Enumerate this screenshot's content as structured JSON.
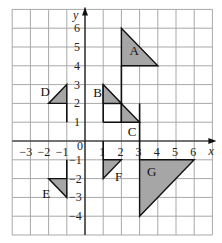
{
  "diagram": {
    "grid": {
      "x_min": -4,
      "x_max": 7,
      "y_min": -5,
      "y_max": 7,
      "origin_px": [
        85,
        141
      ],
      "cell_w": 18.2,
      "cell_h": 18.8
    },
    "axes": {
      "x_label": "x",
      "y_label": "y",
      "origin_label": "0",
      "x_ticks": [
        {
          "value": -3,
          "label": "−3"
        },
        {
          "value": -2,
          "label": "−2"
        },
        {
          "value": -1,
          "label": "−1"
        },
        {
          "value": 1,
          "label": "1"
        },
        {
          "value": 2,
          "label": "2"
        },
        {
          "value": 3,
          "label": "3"
        },
        {
          "value": 4,
          "label": "4"
        },
        {
          "value": 5,
          "label": "5"
        },
        {
          "value": 6,
          "label": "6"
        }
      ],
      "y_ticks": [
        {
          "value": 6,
          "label": "6"
        },
        {
          "value": 5,
          "label": "5"
        },
        {
          "value": 4,
          "label": "4"
        },
        {
          "value": 3,
          "label": "3"
        },
        {
          "value": 2,
          "label": "2"
        },
        {
          "value": 1,
          "label": "1"
        },
        {
          "value": -1,
          "label": "−1"
        },
        {
          "value": -2,
          "label": "−2"
        },
        {
          "value": -3,
          "label": "−3"
        },
        {
          "value": -4,
          "label": "−4"
        }
      ]
    },
    "shapes": [
      {
        "label": "A",
        "vertices": [
          [
            2,
            6
          ],
          [
            2,
            4
          ],
          [
            4,
            4
          ]
        ],
        "label_pos": [
          2.45,
          4.6
        ]
      },
      {
        "label": "B",
        "vertices": [
          [
            1,
            3
          ],
          [
            1,
            2
          ],
          [
            2,
            2
          ]
        ],
        "label_pos": [
          0.45,
          2.35
        ]
      },
      {
        "label": "C",
        "vertices": [
          [
            2,
            2
          ],
          [
            2,
            1
          ],
          [
            3,
            1
          ]
        ],
        "label_pos": [
          2.35,
          0.25
        ]
      },
      {
        "label": "D",
        "vertices": [
          [
            -1,
            3
          ],
          [
            -1,
            2
          ],
          [
            -2,
            2
          ]
        ],
        "label_pos": [
          -2.45,
          2.4
        ]
      },
      {
        "label": "E",
        "vertices": [
          [
            -2,
            -2
          ],
          [
            -1,
            -2
          ],
          [
            -1,
            -3
          ]
        ],
        "label_pos": [
          -2.35,
          -3.05
        ]
      },
      {
        "label": "F",
        "vertices": [
          [
            1,
            -1
          ],
          [
            2,
            -1
          ],
          [
            1,
            -2
          ]
        ],
        "label_pos": [
          1.65,
          -2.15
        ]
      },
      {
        "label": "G",
        "vertices": [
          [
            3,
            -1
          ],
          [
            6,
            -1
          ],
          [
            3,
            -4
          ]
        ],
        "label_pos": [
          3.4,
          -1.85
        ]
      }
    ],
    "bold_segments": [
      [
        [
          2,
          4
        ],
        [
          2,
          1
        ]
      ],
      [
        [
          1,
          3
        ],
        [
          1,
          1
        ]
      ],
      [
        [
          1,
          2
        ],
        [
          2,
          2
        ]
      ],
      [
        [
          1,
          1
        ],
        [
          3,
          1
        ]
      ],
      [
        [
          3,
          2
        ],
        [
          3,
          -1
        ]
      ],
      [
        [
          -1,
          2
        ],
        [
          -1,
          1
        ]
      ],
      [
        [
          -1,
          -1
        ],
        [
          -1,
          -2
        ]
      ],
      [
        [
          1,
          0
        ],
        [
          1,
          -1
        ]
      ]
    ],
    "colors": {
      "fill": "#a6a6a6",
      "grid": "#a8a8a8",
      "ink": "#111111"
    }
  }
}
